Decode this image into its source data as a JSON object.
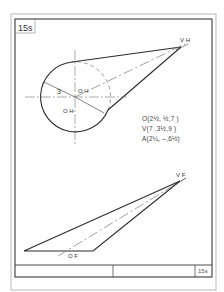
{
  "sheet": {
    "id": "15s",
    "title_block_id": "15s"
  },
  "top_view": {
    "labels": {
      "apex": "V H",
      "center": "O H",
      "center_alt": "O H",
      "radius": "3"
    }
  },
  "front_view": {
    "labels": {
      "apex": "V F",
      "center": "O F"
    }
  },
  "coordinates": [
    {
      "point": "O",
      "text": "O(2½, ½,7 )"
    },
    {
      "point": "V",
      "text": "V(7 ,3½,9 )"
    },
    {
      "point": "A",
      "text": "A(2¼, –,6½)"
    }
  ],
  "colors": {
    "line": "#2b2b2b",
    "border_outer": "#b0b0b0",
    "construction": "#7a7a7a"
  }
}
